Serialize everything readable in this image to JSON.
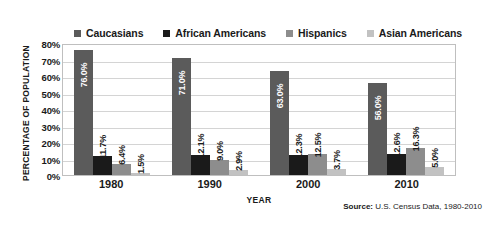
{
  "chart_data": {
    "type": "bar",
    "title": "",
    "xlabel": "YEAR",
    "ylabel": "PERCENTAGE OF POPULATION",
    "categories": [
      "1980",
      "1990",
      "2000",
      "2010"
    ],
    "ylim": [
      0,
      80
    ],
    "ytick_labels": [
      "80%",
      "70%",
      "60%",
      "50%",
      "40%",
      "30%",
      "20%",
      "10%",
      "0%"
    ],
    "ytick_values": [
      80,
      70,
      60,
      50,
      40,
      30,
      20,
      10,
      0
    ],
    "grid": true,
    "legend_position": "top",
    "series": [
      {
        "name": "Caucasians",
        "color": "#5b5b5b",
        "values": [
          76.0,
          71.0,
          63.0,
          56.0
        ],
        "labels": [
          "76.0%",
          "71.0%",
          "63.0%",
          "56.0%"
        ]
      },
      {
        "name": "African Americans",
        "color": "#1a1a1a",
        "values": [
          11.7,
          12.1,
          12.3,
          12.6
        ],
        "labels": [
          "11.7%",
          "12.1%",
          "12.3%",
          "12.6%"
        ]
      },
      {
        "name": "Hispanics",
        "color": "#8d8d8d",
        "values": [
          6.4,
          9.0,
          12.5,
          16.3
        ],
        "labels": [
          "6.4%",
          "9.0%",
          "12.5%",
          "16.3%"
        ]
      },
      {
        "name": "Asian Americans",
        "color": "#c2c2c2",
        "values": [
          1.5,
          2.9,
          3.7,
          5.0
        ],
        "labels": [
          "1.5%",
          "2.9%",
          "3.7%",
          "5.0%"
        ]
      }
    ],
    "annotations": {
      "source_prefix": "Source:",
      "source_text": "U.S. Census Data, 1980-2010"
    }
  }
}
